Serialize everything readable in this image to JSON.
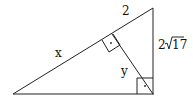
{
  "diagram": {
    "type": "right-triangle-with-altitude",
    "labels": {
      "hypotenuse_short_segment": "2",
      "hypotenuse_long_segment": "x",
      "altitude": "y",
      "vertical_leg_coeff": "2",
      "vertical_leg_radicand": "17"
    },
    "right_angle_marks": [
      "altitude-foot",
      "bottom-right-corner"
    ],
    "stroke_color": "#222222"
  }
}
